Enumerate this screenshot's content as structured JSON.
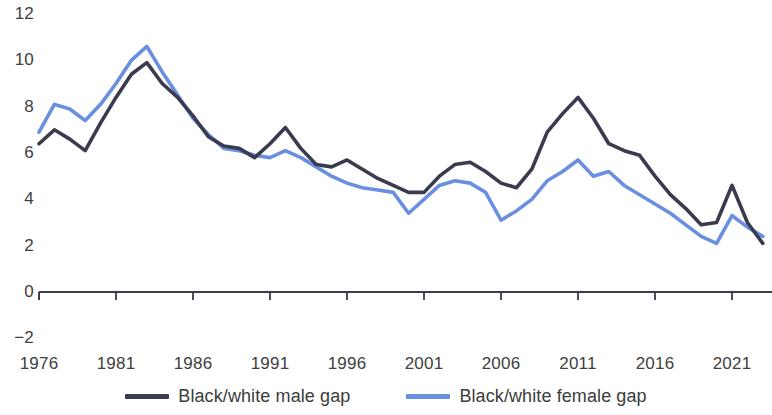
{
  "chart_data": {
    "type": "line",
    "title": "",
    "subtitle": "",
    "xlabel": "",
    "ylabel": "",
    "xlim": [
      1976,
      2023
    ],
    "ylim": [
      -2,
      12
    ],
    "grid": false,
    "legend_position": "bottom-center",
    "y_ticks": [
      12,
      10,
      8,
      6,
      4,
      2,
      0,
      -2
    ],
    "y_tick_labels": [
      "12",
      "10",
      "8",
      "6",
      "4",
      "2",
      "0",
      "−2"
    ],
    "x_ticks": [
      1976,
      1981,
      1986,
      1991,
      1996,
      2001,
      2006,
      2011,
      2016,
      2021
    ],
    "x_tick_labels": [
      "1976",
      "1981",
      "1986",
      "1991",
      "1996",
      "2001",
      "2006",
      "2011",
      "2016",
      "2021"
    ],
    "x": [
      1976,
      1977,
      1978,
      1979,
      1980,
      1981,
      1982,
      1983,
      1984,
      1985,
      1986,
      1987,
      1988,
      1989,
      1990,
      1991,
      1992,
      1993,
      1994,
      1995,
      1996,
      1997,
      1998,
      1999,
      2000,
      2001,
      2002,
      2003,
      2004,
      2005,
      2006,
      2007,
      2008,
      2009,
      2010,
      2011,
      2012,
      2013,
      2014,
      2015,
      2016,
      2017,
      2018,
      2019,
      2020,
      2021,
      2022,
      2023
    ],
    "series": [
      {
        "name": "Black/white male gap",
        "color": "#3b3b4f",
        "values": [
          6.4,
          7.0,
          6.6,
          6.1,
          7.3,
          8.4,
          9.4,
          9.9,
          9.0,
          8.4,
          7.6,
          6.7,
          6.3,
          6.2,
          5.8,
          6.4,
          7.1,
          6.2,
          5.5,
          5.4,
          5.7,
          5.3,
          4.9,
          4.6,
          4.3,
          4.3,
          5.0,
          5.5,
          5.6,
          5.2,
          4.7,
          4.5,
          5.3,
          6.9,
          7.7,
          8.4,
          7.5,
          6.4,
          6.1,
          5.9,
          5.0,
          4.2,
          3.6,
          2.9,
          3.0,
          4.6,
          3.0,
          2.1
        ]
      },
      {
        "name": "Black/white female gap",
        "color": "#6b8fe0",
        "values": [
          6.9,
          8.1,
          7.9,
          7.4,
          8.1,
          9.0,
          10.0,
          10.6,
          9.5,
          8.5,
          7.5,
          6.8,
          6.2,
          6.1,
          5.9,
          5.8,
          6.1,
          5.8,
          5.4,
          5.0,
          4.7,
          4.5,
          4.4,
          4.3,
          3.4,
          4.0,
          4.6,
          4.8,
          4.7,
          4.3,
          3.1,
          3.5,
          4.0,
          4.8,
          5.2,
          5.7,
          5.0,
          5.2,
          4.6,
          4.2,
          3.8,
          3.4,
          2.9,
          2.4,
          2.1,
          3.3,
          2.8,
          2.4
        ]
      }
    ]
  },
  "legend": {
    "items": [
      {
        "label": "Black/white male gap",
        "color": "#3b3b4f"
      },
      {
        "label": "Black/white female gap",
        "color": "#6b8fe0"
      }
    ]
  },
  "axis": {
    "zero_line_color": "#3b3b4f"
  }
}
